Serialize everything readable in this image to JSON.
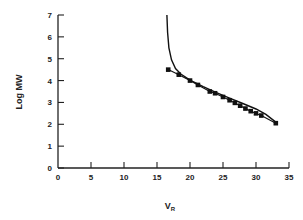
{
  "chart_data": {
    "type": "scatter",
    "title": "",
    "xlabel": "V",
    "xlabel_subscript": "R",
    "ylabel": "Log MW",
    "xlim": [
      0,
      35
    ],
    "ylim": [
      0,
      7
    ],
    "xticks": [
      0,
      5,
      10,
      15,
      20,
      25,
      30,
      35
    ],
    "yticks": [
      0,
      1,
      2,
      3,
      4,
      5,
      6,
      7
    ],
    "grid": false,
    "legend": null,
    "series": [
      {
        "name": "measured",
        "marker": "square",
        "connected": true,
        "points": [
          [
            16.7,
            4.5
          ],
          [
            18.3,
            4.27
          ],
          [
            20.0,
            4.0
          ],
          [
            21.2,
            3.8
          ],
          [
            23.0,
            3.5
          ],
          [
            23.8,
            3.42
          ],
          [
            25.0,
            3.25
          ],
          [
            26.0,
            3.1
          ],
          [
            26.8,
            2.98
          ],
          [
            27.6,
            2.85
          ],
          [
            28.4,
            2.72
          ],
          [
            29.2,
            2.6
          ],
          [
            30.0,
            2.5
          ],
          [
            30.8,
            2.4
          ],
          [
            33.0,
            2.05
          ]
        ]
      },
      {
        "name": "fitted curve",
        "marker": "none",
        "connected": true,
        "points": [
          [
            16.5,
            7.0
          ],
          [
            16.6,
            6.2
          ],
          [
            16.8,
            5.5
          ],
          [
            17.2,
            4.95
          ],
          [
            17.8,
            4.55
          ],
          [
            18.6,
            4.3
          ],
          [
            20.0,
            4.02
          ],
          [
            22.0,
            3.72
          ],
          [
            24.0,
            3.45
          ],
          [
            26.0,
            3.2
          ],
          [
            28.0,
            2.95
          ],
          [
            30.0,
            2.7
          ],
          [
            31.5,
            2.45
          ],
          [
            33.0,
            2.1
          ]
        ]
      }
    ]
  },
  "axes": {
    "ylabel": "Log MW",
    "xlabel_main": "V",
    "xlabel_sub": "R"
  }
}
